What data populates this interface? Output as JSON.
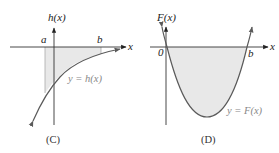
{
  "figure": {
    "panels": [
      {
        "id": "C",
        "caption": "(C)",
        "y_axis_label": "h(x)",
        "x_axis_label": "x",
        "curve_label": "y = h(x)",
        "interval_labels": {
          "left": "a",
          "right": "b"
        },
        "description": "Increasing concave-down curve below x-axis approaching it asymptotically; region between a and b shaded between curve and x-axis"
      },
      {
        "id": "D",
        "caption": "(D)",
        "y_axis_label": "F(x)",
        "x_axis_label": "x",
        "curve_label": "y = F(x)",
        "interval_labels": {
          "left": "0",
          "right": "b"
        },
        "description": "Upward parabola with roots at 0 and b; region between 0 and b below x-axis shaded"
      }
    ],
    "colors": {
      "curve": "#5a5a5a",
      "axis": "#333333",
      "shade": "#e6e6e6",
      "label_gray": "#888888"
    }
  }
}
